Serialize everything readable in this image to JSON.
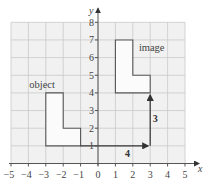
{
  "diagram": {
    "type": "translation",
    "axes": {
      "x_label": "x",
      "y_label": "y",
      "x_range": [
        -5,
        5
      ],
      "y_range": [
        0,
        8
      ],
      "x_ticks": [
        "−5",
        "−4",
        "−3",
        "−2",
        "−1",
        "0",
        "1",
        "2",
        "3",
        "4",
        "5"
      ],
      "y_ticks": [
        "1",
        "2",
        "3",
        "4",
        "5",
        "6",
        "7",
        "8"
      ]
    },
    "object": {
      "label": "object",
      "vertices": [
        [
          -3,
          1
        ],
        [
          -3,
          4
        ],
        [
          -2,
          4
        ],
        [
          -2,
          2
        ],
        [
          -1,
          2
        ],
        [
          -1,
          1
        ]
      ]
    },
    "image": {
      "label": "image",
      "vertices": [
        [
          1,
          4
        ],
        [
          1,
          7
        ],
        [
          2,
          7
        ],
        [
          2,
          5
        ],
        [
          3,
          5
        ],
        [
          3,
          4
        ]
      ]
    },
    "vectors": [
      {
        "from": [
          -1,
          1
        ],
        "to": [
          3,
          1
        ],
        "label": "4"
      },
      {
        "from": [
          3,
          1
        ],
        "to": [
          3,
          4
        ],
        "label": "3"
      }
    ],
    "colors": {
      "grid_bg": "#f1f1f1",
      "gridline": "#c9c9c9",
      "outline": "#555555"
    }
  }
}
